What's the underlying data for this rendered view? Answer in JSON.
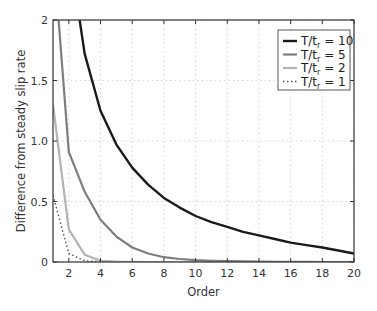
{
  "chart_data": {
    "type": "line",
    "title": "",
    "xlabel": "Order",
    "ylabel": "Difference from steady slip rate",
    "xlim": [
      1,
      20
    ],
    "ylim": [
      0,
      2
    ],
    "xticks": [
      2,
      4,
      6,
      8,
      10,
      12,
      14,
      16,
      18,
      20
    ],
    "yticks": [
      0,
      0.5,
      1.0,
      1.5,
      2
    ],
    "ytick_labels": [
      "0",
      "0.5",
      "1.0",
      "1.5",
      "2"
    ],
    "grid": true,
    "legend_position": "upper right",
    "x": [
      1,
      2,
      3,
      4,
      5,
      6,
      7,
      8,
      9,
      10,
      11,
      12,
      13,
      14,
      15,
      16,
      17,
      18,
      19,
      20
    ],
    "series": [
      {
        "name": "T/tr = 10",
        "label_main": "T/t",
        "label_sub": "r",
        "label_tail": " = 10",
        "color": "#1a1a1a",
        "style": "solid",
        "width": 2.4,
        "values": [
          3.5,
          2.6,
          1.72,
          1.25,
          0.97,
          0.78,
          0.64,
          0.53,
          0.45,
          0.38,
          0.33,
          0.29,
          0.25,
          0.22,
          0.19,
          0.16,
          0.14,
          0.12,
          0.095,
          0.07
        ]
      },
      {
        "name": "T/tr = 5",
        "label_main": "T/t",
        "label_sub": "r",
        "label_tail": " = 5",
        "color": "#7d7d7d",
        "style": "solid",
        "width": 2.2,
        "values": [
          2.6,
          0.91,
          0.58,
          0.35,
          0.21,
          0.12,
          0.07,
          0.04,
          0.025,
          0.015,
          0.01,
          0.007,
          0.005,
          0.003,
          0.002,
          0.001,
          0.001,
          0.0,
          0.0,
          0.0
        ]
      },
      {
        "name": "T/tr = 2",
        "label_main": "T/t",
        "label_sub": "r",
        "label_tail": " = 2",
        "color": "#b3b3b3",
        "style": "solid",
        "width": 2.2,
        "values": [
          1.3,
          0.27,
          0.06,
          0.01,
          0.003,
          0.001,
          0.0,
          0.0,
          0.0,
          0.0,
          0.0,
          0.0,
          0.0,
          0.0,
          0.0,
          0.0,
          0.0,
          0.0,
          0.0,
          0.0
        ]
      },
      {
        "name": "T/tr = 1",
        "label_main": "T/t",
        "label_sub": "r",
        "label_tail": " = 1",
        "color": "#555555",
        "style": "dotted",
        "width": 1.4,
        "values": [
          0.55,
          0.07,
          0.01,
          0.002,
          0.0,
          0.0,
          0.0,
          0.0,
          0.0,
          0.0,
          0.0,
          0.0,
          0.0,
          0.0,
          0.0,
          0.0,
          0.0,
          0.0,
          0.0,
          0.0
        ]
      }
    ]
  }
}
